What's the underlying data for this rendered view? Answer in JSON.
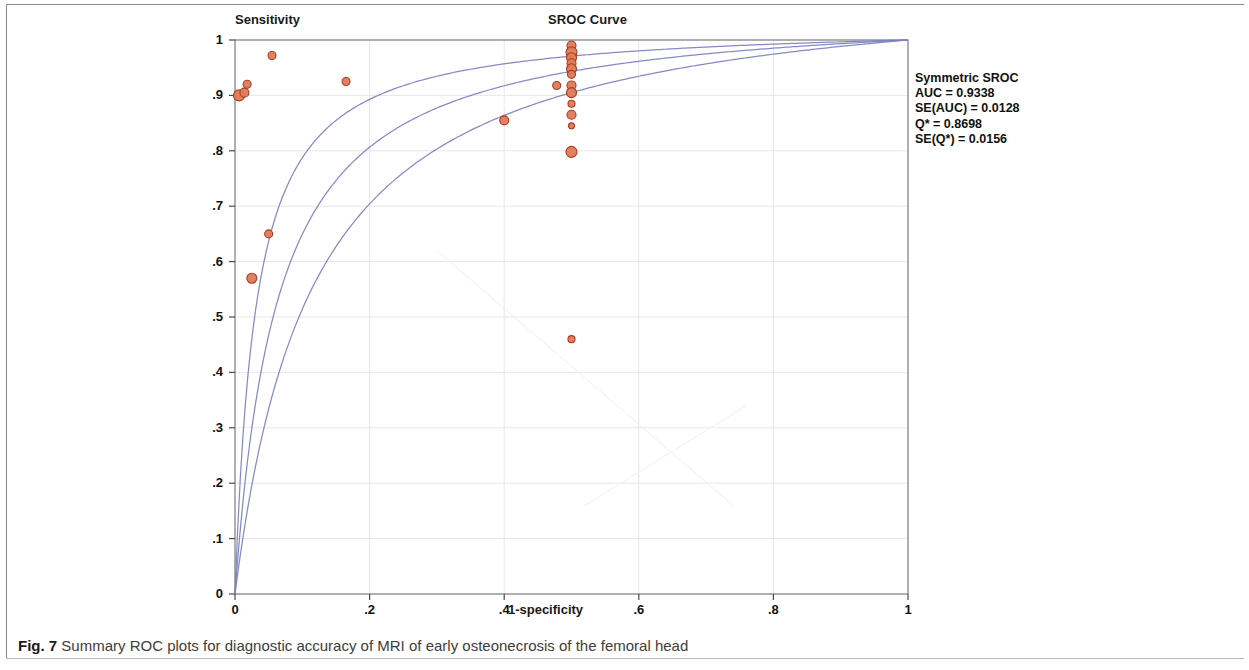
{
  "figure": {
    "caption_label": "Fig. 7",
    "caption_text": "Summary ROC plots for diagnostic accuracy of MRI of early osteonecrosis of the femoral head"
  },
  "stats": {
    "heading": "Symmetric SROC",
    "auc_line": "AUC = 0.9338",
    "se_auc_line": "SE(AUC) = 0.0128",
    "qstar_line": "Q* = 0.8698",
    "se_qstar_line": "SE(Q*) = 0.0156"
  },
  "chart_data": {
    "type": "scatter",
    "title": "SROC Curve",
    "xlabel": "1-specificity",
    "ylabel": "Sensitivity",
    "xlim": [
      0,
      1
    ],
    "ylim": [
      0,
      1
    ],
    "grid": true,
    "legend": "none",
    "marker_color": "#e07a57",
    "marker_edge_color": "#a83b20",
    "curve_color": "#7b80c0",
    "xticks": [
      "0",
      ".2",
      ".4",
      ".6",
      ".8",
      "1"
    ],
    "xtick_values": [
      0,
      0.2,
      0.4,
      0.6,
      0.8,
      1
    ],
    "yticks": [
      "0",
      ".1",
      ".2",
      ".3",
      ".4",
      ".5",
      ".6",
      ".7",
      ".8",
      ".9",
      "1"
    ],
    "ytick_values": [
      0,
      0.1,
      0.2,
      0.3,
      0.4,
      0.5,
      0.6,
      0.7,
      0.8,
      0.9,
      1
    ],
    "points": [
      {
        "x": 0.006,
        "y": 0.9,
        "size": 11
      },
      {
        "x": 0.014,
        "y": 0.905,
        "size": 9
      },
      {
        "x": 0.018,
        "y": 0.92,
        "size": 8
      },
      {
        "x": 0.055,
        "y": 0.972,
        "size": 8
      },
      {
        "x": 0.165,
        "y": 0.925,
        "size": 8
      },
      {
        "x": 0.05,
        "y": 0.65,
        "size": 8
      },
      {
        "x": 0.025,
        "y": 0.57,
        "size": 10
      },
      {
        "x": 0.4,
        "y": 0.855,
        "size": 9
      },
      {
        "x": 0.5,
        "y": 0.99,
        "size": 9
      },
      {
        "x": 0.5,
        "y": 0.978,
        "size": 11
      },
      {
        "x": 0.5,
        "y": 0.968,
        "size": 10
      },
      {
        "x": 0.5,
        "y": 0.958,
        "size": 9
      },
      {
        "x": 0.5,
        "y": 0.948,
        "size": 10
      },
      {
        "x": 0.5,
        "y": 0.938,
        "size": 8
      },
      {
        "x": 0.5,
        "y": 0.918,
        "size": 9
      },
      {
        "x": 0.478,
        "y": 0.918,
        "size": 8
      },
      {
        "x": 0.5,
        "y": 0.905,
        "size": 10
      },
      {
        "x": 0.5,
        "y": 0.885,
        "size": 7
      },
      {
        "x": 0.5,
        "y": 0.865,
        "size": 9
      },
      {
        "x": 0.5,
        "y": 0.845,
        "size": 6
      },
      {
        "x": 0.5,
        "y": 0.798,
        "size": 11
      },
      {
        "x": 0.5,
        "y": 0.46,
        "size": 7
      }
    ],
    "curves": [
      {
        "name": "sroc-curve-lower",
        "shape": "roc",
        "steepness": 0.03
      },
      {
        "name": "sroc-curve-center",
        "shape": "roc",
        "steepness": 0.06
      },
      {
        "name": "sroc-curve-upper",
        "shape": "roc",
        "steepness": 0.105
      }
    ]
  }
}
